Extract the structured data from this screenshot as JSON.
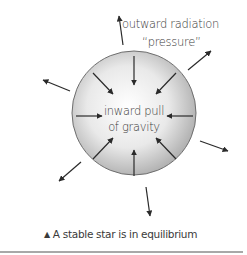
{
  "diagram": {
    "outward_label_line1": "outward radiation",
    "outward_label_line2": "“pressure”",
    "inward_label_line1": "inward pull",
    "inward_label_line2": "of gravity",
    "caption_marker": "▲",
    "caption_text": "A stable star is in equilibrium",
    "colors": {
      "star_center": "#ffffff",
      "star_edge": "#a9a9a9",
      "star_outline": "#6e6e6e",
      "arrow": "#2a2a2a",
      "text": "#3a3a3a",
      "rule": "#a8a8a8"
    }
  }
}
